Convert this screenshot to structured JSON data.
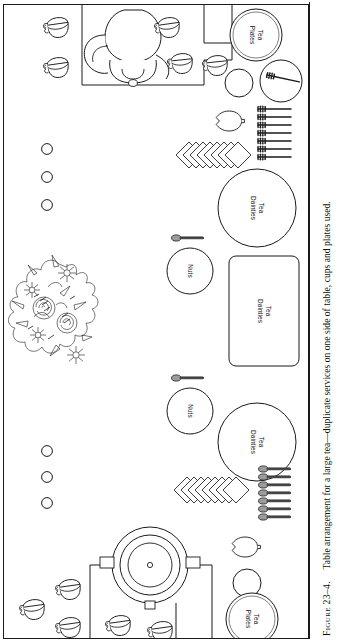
{
  "figure": {
    "number": "Figure 23–4.",
    "caption": "Table arrangement for a large tea—duplicate services on one side of table, cups and plates used.",
    "full_caption": "Figure 23–4.  Table arrangement for a large tea—duplicate services on one side of table, cups and plates used."
  },
  "diagram": {
    "border_color": "#1a1a1a",
    "background_color": "#ffffff",
    "ink_color": "#1a1a1a",
    "labels": {
      "tea_plates_top": "Tea\nPlates",
      "tea_plates_bottom": "Tea\nPlates",
      "tea_dainties_upper_circle": "Tea\nDainties",
      "tea_dainties_center_rect": "Tea\nDainties",
      "tea_dainties_lower_circle": "Tea\nDainties",
      "nuts_upper": "Nuts",
      "nuts_lower": "Nuts"
    },
    "items": [
      {
        "name": "teapot-top",
        "kind": "teapot",
        "count": 1
      },
      {
        "name": "tray-top",
        "kind": "tray",
        "count": 1
      },
      {
        "name": "teacups-top-left",
        "kind": "teacup",
        "count": 2
      },
      {
        "name": "teacups-top-tray",
        "kind": "teacup",
        "count": 3
      },
      {
        "name": "tea-plates-stack-top",
        "kind": "plate-stack",
        "count": 1
      },
      {
        "name": "small-plate-top",
        "kind": "plate",
        "count": 1
      },
      {
        "name": "plate-with-fork-top",
        "kind": "plate-with-fork",
        "count": 1
      },
      {
        "name": "lemon-dish-top",
        "kind": "lemon-dish",
        "count": 1
      },
      {
        "name": "forks-row-top",
        "kind": "fork-row",
        "count": 7
      },
      {
        "name": "napkin-stack-top",
        "kind": "napkin-stack",
        "count": 8
      },
      {
        "name": "sugar-cubes-top",
        "kind": "small-circle",
        "count": 3
      },
      {
        "name": "tea-dainties-plate-upper",
        "kind": "round-plate",
        "count": 1
      },
      {
        "name": "nuts-bowl-upper",
        "kind": "bowl",
        "count": 1
      },
      {
        "name": "nut-spoon-upper",
        "kind": "spoon",
        "count": 1
      },
      {
        "name": "tea-dainties-tray-center",
        "kind": "rect-tray",
        "count": 1
      },
      {
        "name": "flower-arrangement",
        "kind": "flowers",
        "count": 1
      },
      {
        "name": "nuts-bowl-lower",
        "kind": "bowl",
        "count": 1
      },
      {
        "name": "nut-spoon-lower",
        "kind": "spoon",
        "count": 1
      },
      {
        "name": "tea-dainties-plate-lower",
        "kind": "round-plate",
        "count": 1
      },
      {
        "name": "napkin-stack-bottom",
        "kind": "napkin-stack",
        "count": 8
      },
      {
        "name": "spoons-row-bottom",
        "kind": "spoon-row",
        "count": 7
      },
      {
        "name": "sugar-cubes-bottom",
        "kind": "small-circle",
        "count": 3
      },
      {
        "name": "lemon-dish-bottom",
        "kind": "lemon-dish",
        "count": 1
      },
      {
        "name": "small-plate-bottom",
        "kind": "plate",
        "count": 1
      },
      {
        "name": "tea-plates-stack-bottom",
        "kind": "plate-stack",
        "count": 1
      },
      {
        "name": "coffee-urn-bottom",
        "kind": "urn",
        "count": 1
      },
      {
        "name": "tray-bottom",
        "kind": "tray",
        "count": 1
      },
      {
        "name": "teacups-bottom-left",
        "kind": "teacup",
        "count": 3
      },
      {
        "name": "teacups-bottom-tray",
        "kind": "teacup",
        "count": 2
      }
    ]
  }
}
